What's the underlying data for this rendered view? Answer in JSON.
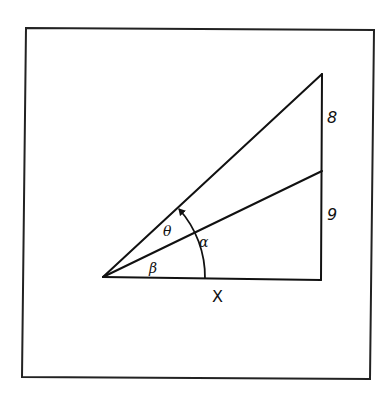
{
  "figure": {
    "type": "geometry-diagram",
    "colors": {
      "ink": "#111111",
      "background": "#ffffff",
      "frame": "#222222"
    },
    "labels": {
      "upper_segment": "8",
      "lower_segment": "9",
      "base": "X",
      "theta": "θ",
      "alpha": "α",
      "beta": "β"
    },
    "segments": {
      "vertical_upper_length": 8,
      "vertical_lower_length": 9,
      "base_length": "X"
    },
    "angles": [
      {
        "name": "beta",
        "symbol": "β",
        "between": "base and lower ray"
      },
      {
        "name": "theta",
        "symbol": "θ",
        "between": "lower ray and upper ray"
      },
      {
        "name": "alpha",
        "symbol": "α",
        "between": "base and upper ray",
        "relation": "α = β + θ"
      }
    ]
  }
}
